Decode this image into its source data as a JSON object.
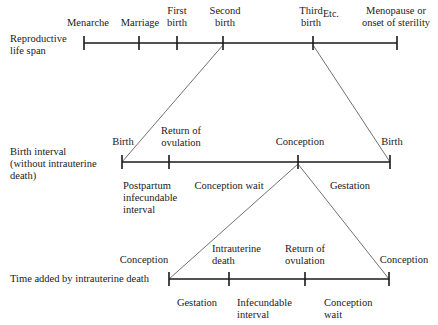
{
  "rows": {
    "reproductive": {
      "title": [
        "Reproductive",
        "life span"
      ],
      "events": [
        {
          "label": [
            "Menarche"
          ]
        },
        {
          "label": [
            "Marriage"
          ]
        },
        {
          "label": [
            "First",
            "birth"
          ]
        },
        {
          "label": [
            "Second",
            "birth"
          ]
        },
        {
          "label": [
            "Third",
            "birth"
          ]
        },
        {
          "label": [
            "Etc."
          ]
        },
        {
          "label": [
            "Menopause or",
            "onset of sterility"
          ]
        }
      ]
    },
    "birth_interval": {
      "title": [
        "Birth interval",
        "(without intrauterine",
        "death)"
      ],
      "events": [
        {
          "label": [
            "Birth"
          ]
        },
        {
          "label": [
            "Return of",
            "ovulation"
          ]
        },
        {
          "label": [
            "Conception"
          ]
        },
        {
          "label": [
            "Birth"
          ]
        }
      ],
      "segments": [
        {
          "label": [
            "Postpartum",
            "infecundable",
            "interval"
          ]
        },
        {
          "label": [
            "Conception wait"
          ]
        },
        {
          "label": [
            "Gestation"
          ]
        }
      ]
    },
    "intrauterine": {
      "title": [
        "Time added by intrauterine death"
      ],
      "events": [
        {
          "label": [
            "Conception"
          ]
        },
        {
          "label": [
            "Intrauterine",
            "death"
          ]
        },
        {
          "label": [
            "Return of",
            "ovulation"
          ]
        },
        {
          "label": [
            "Conception"
          ]
        }
      ],
      "segments": [
        {
          "label": [
            "Gestation"
          ]
        },
        {
          "label": [
            "Infecundable",
            "interval"
          ]
        },
        {
          "label": [
            "Conception",
            "wait"
          ]
        }
      ]
    }
  }
}
